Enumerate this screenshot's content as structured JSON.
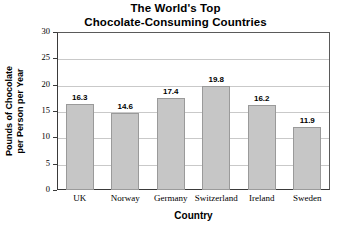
{
  "chart_data": {
    "type": "bar",
    "title": "The World's Top Chocolate-Consuming Countries",
    "title_line1": "The World's Top",
    "title_line2": "Chocolate-Consuming Countries",
    "categories": [
      "UK",
      "Norway",
      "Germany",
      "Switzerland",
      "Ireland",
      "Sweden"
    ],
    "values": [
      16.3,
      14.6,
      17.4,
      19.8,
      16.2,
      11.9
    ],
    "value_labels": [
      "16.3",
      "14.6",
      "17.4",
      "19.8",
      "16.2",
      "11.9"
    ],
    "xlabel": "Country",
    "ylabel": "Pounds of Chocolate per Person per Year",
    "ylabel_line1": "Pounds of Chocolate",
    "ylabel_line2": "per Person per Year",
    "ylim": [
      0,
      30
    ],
    "yticks": [
      0,
      5,
      10,
      15,
      20,
      25,
      30
    ],
    "ytick_labels": [
      "0",
      "5",
      "10",
      "15",
      "20",
      "25",
      "30"
    ],
    "grid": true,
    "grid_axis": "y",
    "legend": false,
    "bar_color": "#c6c6c6",
    "bar_edge_color": "#9a9a9a",
    "axis_color": "#3a3a3a",
    "grid_color": "#c9c9c9",
    "background": "#ffffff"
  }
}
